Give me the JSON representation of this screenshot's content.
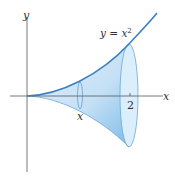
{
  "diagram": {
    "labels": {
      "y_axis": "y",
      "x_axis": "x",
      "curve_base": "y = x",
      "curve_exp": "2",
      "cross_section": "x",
      "tick_2": "2"
    },
    "colors": {
      "curve": "#3a7fc4",
      "fill_light": "#d6eaf8",
      "fill_dark": "#8cc4ec",
      "axis": "#555555",
      "text": "#333333"
    }
  }
}
